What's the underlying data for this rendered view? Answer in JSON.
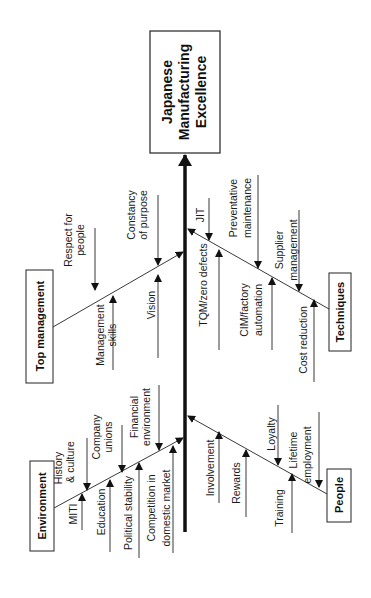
{
  "diagram": {
    "type": "fishbone (Ishikawa) cause-and-effect diagram, rotated 90° counter-clockwise",
    "effect": {
      "line1": "Japanese",
      "line2": "Manufacturing",
      "line3": "Excellence"
    },
    "categories": {
      "top_management": {
        "label": "Top management",
        "causes": [
          {
            "line1": "Respect for",
            "line2": "people"
          },
          {
            "line1": "Management",
            "line2": "skills"
          },
          {
            "line1": "Constancy",
            "line2": "of purpose"
          },
          {
            "line1": "Vision",
            "line2": ""
          }
        ]
      },
      "environment": {
        "label": "Environment",
        "causes": [
          {
            "line1": "History",
            "line2": "& culture"
          },
          {
            "line1": "MITI",
            "line2": ""
          },
          {
            "line1": "Company",
            "line2": "unions"
          },
          {
            "line1": "Education",
            "line2": ""
          },
          {
            "line1": "Political stability",
            "line2": ""
          },
          {
            "line1": "Financial",
            "line2": "environment"
          },
          {
            "line1": "Competition in",
            "line2": "domestic market"
          }
        ]
      },
      "techniques": {
        "label": "Techniques",
        "causes": [
          {
            "line1": "JIT",
            "line2": ""
          },
          {
            "line1": "TQM/zero defects",
            "line2": ""
          },
          {
            "line1": "Preventative",
            "line2": "maintenance"
          },
          {
            "line1": "CIM/factory",
            "line2": "automation"
          },
          {
            "line1": "Supplier",
            "line2": "management"
          },
          {
            "line1": "Cost reduction",
            "line2": ""
          }
        ]
      },
      "people": {
        "label": "People",
        "causes": [
          {
            "line1": "Involvement",
            "line2": ""
          },
          {
            "line1": "Rewards",
            "line2": ""
          },
          {
            "line1": "Loyalty",
            "line2": ""
          },
          {
            "line1": "Training",
            "line2": ""
          },
          {
            "line1": "Lifetime",
            "line2": "employment"
          }
        ]
      }
    }
  }
}
